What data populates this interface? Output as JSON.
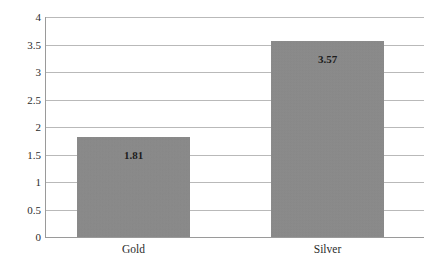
{
  "chart_data": {
    "type": "bar",
    "title": "",
    "subtitle": "",
    "xlabel": "",
    "ylabel": "",
    "categories": [
      "Gold",
      "Silver"
    ],
    "values": [
      1.81,
      3.57
    ],
    "data_labels": [
      "1.81",
      "3.57"
    ],
    "ylim": [
      0,
      4
    ],
    "y_ticks": [
      0,
      0.5,
      1,
      1.5,
      2,
      2.5,
      3,
      3.5,
      4
    ],
    "y_tick_labels": [
      "0",
      "0.5",
      "1",
      "1.5",
      "2",
      "2.5",
      "3",
      "3.5",
      "4"
    ],
    "grid": "horizontal",
    "legend": "none",
    "series": [
      {
        "name": "",
        "values": [
          1.81,
          3.57
        ],
        "color": "#8a8a8a"
      }
    ],
    "colors": {
      "bar_fill": "#8a8a8a",
      "gridline": "#b9b9b9",
      "axis_line": "#9a9a9a",
      "text": "#2b2b2b",
      "data_label_text": "#1c1c1c",
      "background": "#ffffff"
    }
  }
}
